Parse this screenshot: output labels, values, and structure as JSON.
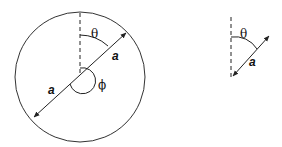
{
  "figure_left": {
    "labels": {
      "theta": "θ",
      "phi": "ϕ",
      "radius_upper": "a",
      "radius_lower": "a"
    }
  },
  "figure_right": {
    "labels": {
      "theta": "θ",
      "radius": "a"
    }
  },
  "colors": {
    "stroke": "#222222",
    "background": "#ffffff"
  }
}
